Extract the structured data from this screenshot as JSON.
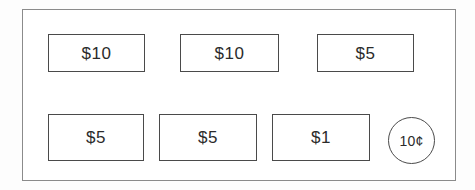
{
  "diagram": {
    "background_color": "#fdfdfd",
    "frame": {
      "name": "outer-frame",
      "x": 22,
      "y": 9,
      "width": 434,
      "height": 172,
      "stroke_color": "#8b8b8b",
      "fill_color": "#ffffff"
    },
    "tokens": [
      {
        "id": "bill-10-a",
        "shape": "rectangle",
        "label": "$10",
        "value": 10,
        "unit": "dollars",
        "row": 1,
        "column": 1,
        "x": 47,
        "y": 33,
        "width": 97,
        "height": 38,
        "stroke_color": "#4a4a4a",
        "fill_color": "#ffffff"
      },
      {
        "id": "bill-10-b",
        "shape": "rectangle",
        "label": "$10",
        "value": 10,
        "unit": "dollars",
        "row": 1,
        "column": 2,
        "x": 179,
        "y": 33,
        "width": 99,
        "height": 38,
        "stroke_color": "#4a4a4a",
        "fill_color": "#ffffff"
      },
      {
        "id": "bill-5-a",
        "shape": "rectangle",
        "label": "$5",
        "value": 5,
        "unit": "dollars",
        "row": 1,
        "column": 3,
        "x": 316,
        "y": 33,
        "width": 97,
        "height": 38,
        "stroke_color": "#4a4a4a",
        "fill_color": "#ffffff"
      },
      {
        "id": "bill-5-b",
        "shape": "rectangle",
        "label": "$5",
        "value": 5,
        "unit": "dollars",
        "row": 2,
        "column": 1,
        "x": 47,
        "y": 113,
        "width": 96,
        "height": 47,
        "stroke_color": "#4a4a4a",
        "fill_color": "#ffffff"
      },
      {
        "id": "bill-5-c",
        "shape": "rectangle",
        "label": "$5",
        "value": 5,
        "unit": "dollars",
        "row": 2,
        "column": 2,
        "x": 158,
        "y": 113,
        "width": 98,
        "height": 47,
        "stroke_color": "#4a4a4a",
        "fill_color": "#ffffff"
      },
      {
        "id": "bill-1-a",
        "shape": "rectangle",
        "label": "$1",
        "value": 1,
        "unit": "dollars",
        "row": 2,
        "column": 3,
        "x": 271,
        "y": 113,
        "width": 98,
        "height": 47,
        "stroke_color": "#4a4a4a",
        "fill_color": "#ffffff"
      },
      {
        "id": "coin-10c",
        "shape": "circle",
        "label": "10¢",
        "value": 0.1,
        "unit": "cents",
        "row": 2,
        "column": 4,
        "x": 387,
        "y": 116,
        "width": 47,
        "height": 47,
        "stroke_color": "#4a4a4a",
        "fill_color": "#ffffff"
      }
    ]
  }
}
